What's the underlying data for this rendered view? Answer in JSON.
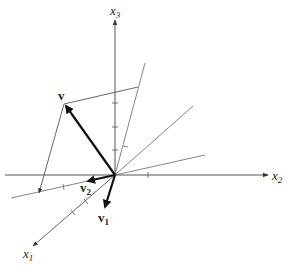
{
  "diagram": {
    "type": "3d-vector-projection",
    "axes": {
      "x1": {
        "label": "x",
        "subscript": "1"
      },
      "x2": {
        "label": "x",
        "subscript": "2"
      },
      "x3": {
        "label": "x",
        "subscript": "3"
      }
    },
    "vectors": {
      "v": {
        "label": "v"
      },
      "v1": {
        "label": "v",
        "subscript": "1"
      },
      "v2": {
        "label": "v",
        "subscript": "2"
      }
    },
    "colors": {
      "line": "#555555",
      "vector": "#1a1a1a",
      "background": "#ffffff"
    }
  }
}
